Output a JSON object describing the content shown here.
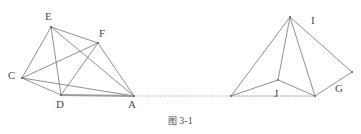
{
  "figure": {
    "caption_cjk": "图",
    "caption_number": "3-1",
    "caption_full": "图 3-1",
    "stroke_color": "#6b6b6b",
    "thick_stroke_color": "#9a9a9a",
    "dotted_color": "#8c8c8c",
    "background_color": "#ffffff",
    "label_color": "#4a4a4a"
  },
  "left_solid": {
    "name": "left-polyhedron",
    "vertices": [
      {
        "id": "E",
        "label": "E",
        "x": 51,
        "y": 27,
        "label_x": 45,
        "label_y": 11
      },
      {
        "id": "F",
        "label": "F",
        "x": 98,
        "y": 43,
        "label_x": 99,
        "label_y": 28
      },
      {
        "id": "C",
        "label": "C",
        "x": 22,
        "y": 78,
        "label_x": 8,
        "label_y": 70
      },
      {
        "id": "D",
        "label": "D",
        "x": 61,
        "y": 95,
        "label_x": 56,
        "label_y": 99
      },
      {
        "id": "A",
        "label": "A",
        "x": 134,
        "y": 96,
        "label_x": 128,
        "label_y": 99
      }
    ],
    "edges": [
      {
        "from": "E",
        "to": "F",
        "style": "solid"
      },
      {
        "from": "E",
        "to": "C",
        "style": "solid"
      },
      {
        "from": "E",
        "to": "D",
        "style": "solid"
      },
      {
        "from": "E",
        "to": "A",
        "style": "solid"
      },
      {
        "from": "F",
        "to": "C",
        "style": "solid"
      },
      {
        "from": "F",
        "to": "D",
        "style": "solid"
      },
      {
        "from": "F",
        "to": "A",
        "style": "solid"
      },
      {
        "from": "C",
        "to": "D",
        "style": "solid"
      },
      {
        "from": "C",
        "to": "A",
        "style": "solid"
      },
      {
        "from": "D",
        "to": "A",
        "style": "thick"
      }
    ]
  },
  "right_solid": {
    "name": "right-pyramid",
    "vertices": [
      {
        "id": "I_apex",
        "label": "",
        "x": 290,
        "y": 17,
        "label_x": 0,
        "label_y": 0
      },
      {
        "id": "I",
        "label": "I",
        "x": 352,
        "y": 72,
        "label_x": 311,
        "label_y": 15
      },
      {
        "id": "G",
        "label": "G",
        "x": 315,
        "y": 96,
        "label_x": 335,
        "label_y": 83
      },
      {
        "id": "J",
        "label": "J",
        "x": 278,
        "y": 80,
        "label_x": 274,
        "label_y": 88
      },
      {
        "id": "K",
        "label": "",
        "x": 231,
        "y": 96,
        "label_x": 0,
        "label_y": 0
      }
    ],
    "edges": [
      {
        "from": "I_apex",
        "to": "K",
        "style": "solid"
      },
      {
        "from": "I_apex",
        "to": "J",
        "style": "solid"
      },
      {
        "from": "I_apex",
        "to": "G",
        "style": "solid"
      },
      {
        "from": "I_apex",
        "to": "I",
        "style": "solid"
      },
      {
        "from": "K",
        "to": "J",
        "style": "solid"
      },
      {
        "from": "J",
        "to": "G",
        "style": "solid"
      },
      {
        "from": "G",
        "to": "I",
        "style": "solid"
      },
      {
        "from": "K",
        "to": "G",
        "style": "dotted"
      }
    ]
  },
  "connector": {
    "name": "baseline-dotted-connector",
    "from_x": 134,
    "from_y": 96,
    "to_x": 231,
    "to_y": 96,
    "style": "dotted"
  }
}
